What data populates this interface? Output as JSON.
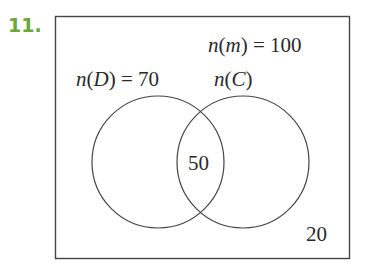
{
  "problem_number": "11.",
  "diagram": {
    "type": "venn",
    "universe_label": "n(m) = 100",
    "set_D_label": "n(D) = 70",
    "set_C_label": "n(C)",
    "intersection_value": "50",
    "outside_value": "20",
    "colors": {
      "number": "#6aa83a",
      "lines": "#333333",
      "text": "#2a2a2a"
    }
  }
}
